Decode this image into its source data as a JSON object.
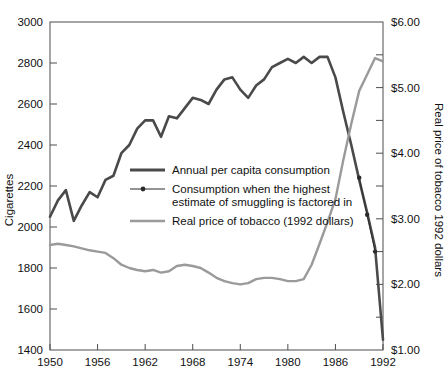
{
  "chart_data": {
    "type": "line",
    "title": "",
    "xlabel": "",
    "ylabel": "Cigarettes",
    "y2label": "Real price of tobacco 1992 dollars",
    "xlim": [
      1950,
      1992
    ],
    "ylim": [
      1400,
      3000
    ],
    "y2lim": [
      1.0,
      6.0
    ],
    "grid": false,
    "legend_position": "inside-left-middle",
    "xticks": [
      1950,
      1956,
      1962,
      1968,
      1974,
      1980,
      1986,
      1992
    ],
    "xticklabels": [
      "1950",
      "1956",
      "1962",
      "1968",
      "1974",
      "1980",
      "1986",
      "1992"
    ],
    "yticks": [
      1400,
      1600,
      1800,
      2000,
      2200,
      2400,
      2600,
      2800,
      3000
    ],
    "yticklabels": [
      "1400",
      "1600",
      "1800",
      "2000",
      "2200",
      "2400",
      "2600",
      "2800",
      "3000"
    ],
    "y2ticks": [
      1.0,
      1.5,
      2.0,
      2.5,
      3.0,
      3.5,
      4.0,
      4.5,
      5.0,
      5.5,
      6.0
    ],
    "y2ticklabels": [
      "$1.00",
      "",
      "$2.00",
      "",
      "$3.00",
      "",
      "$4.00",
      "",
      "$5.00",
      "",
      "$6.00"
    ],
    "series": [
      {
        "name": "Annual per capita consumption",
        "axis": "left",
        "color": "#4a4a4a",
        "width": 2.6,
        "marker": "none",
        "x": [
          1950,
          1951,
          1952,
          1953,
          1954,
          1955,
          1956,
          1957,
          1958,
          1959,
          1960,
          1961,
          1962,
          1963,
          1964,
          1965,
          1966,
          1967,
          1968,
          1969,
          1970,
          1971,
          1972,
          1973,
          1974,
          1975,
          1976,
          1977,
          1978,
          1979,
          1980,
          1981,
          1982,
          1983,
          1984,
          1985,
          1986,
          1987,
          1988,
          1989,
          1990,
          1991,
          1992
        ],
        "values": [
          2050,
          2130,
          2180,
          2030,
          2105,
          2170,
          2145,
          2230,
          2250,
          2360,
          2400,
          2480,
          2520,
          2520,
          2440,
          2540,
          2530,
          2580,
          2630,
          2620,
          2600,
          2670,
          2720,
          2730,
          2670,
          2630,
          2690,
          2720,
          2780,
          2800,
          2820,
          2800,
          2830,
          2800,
          2830,
          2830,
          2730,
          2560,
          2400,
          2230,
          2070,
          1900,
          1450
        ]
      },
      {
        "name": "Consumption when the highest estimate of smuggling is factored in",
        "axis": "left",
        "color": "#2b2b2b",
        "width": 0.9,
        "marker": "dot",
        "x": [
          1989,
          1990,
          1991
        ],
        "values": [
          2240,
          2060,
          1880
        ]
      },
      {
        "name": "Real price of tobacco (1992 dollars)",
        "axis": "right",
        "color": "#9a9a9a",
        "width": 2.4,
        "marker": "none",
        "x": [
          1950,
          1951,
          1952,
          1953,
          1954,
          1955,
          1956,
          1957,
          1958,
          1959,
          1960,
          1961,
          1962,
          1963,
          1964,
          1965,
          1966,
          1967,
          1968,
          1969,
          1970,
          1971,
          1972,
          1973,
          1974,
          1975,
          1976,
          1977,
          1978,
          1979,
          1980,
          1981,
          1982,
          1983,
          1984,
          1985,
          1986,
          1987,
          1988,
          1989,
          1990,
          1991,
          1992
        ],
        "values": [
          2.6,
          2.62,
          2.6,
          2.58,
          2.55,
          2.52,
          2.5,
          2.48,
          2.4,
          2.3,
          2.25,
          2.22,
          2.2,
          2.22,
          2.18,
          2.2,
          2.28,
          2.3,
          2.28,
          2.25,
          2.18,
          2.1,
          2.05,
          2.02,
          2.0,
          2.02,
          2.08,
          2.1,
          2.1,
          2.08,
          2.05,
          2.05,
          2.08,
          2.3,
          2.62,
          2.95,
          3.3,
          3.9,
          4.45,
          4.95,
          5.2,
          5.45,
          5.4
        ]
      }
    ],
    "legend_entries": [
      {
        "style": "thick-line",
        "lines": [
          "Annual per capita consumption"
        ]
      },
      {
        "style": "dot-line",
        "lines": [
          "Consumption when the highest",
          "estimate of smuggling is factored in"
        ]
      },
      {
        "style": "light-line",
        "lines": [
          "Real price of tobacco (1992 dollars)"
        ]
      }
    ],
    "colors": {
      "consumption": "#4a4a4a",
      "smuggling": "#2b2b2b",
      "price": "#9a9a9a",
      "axis": "#4d4d4d",
      "background": "#ffffff"
    }
  }
}
